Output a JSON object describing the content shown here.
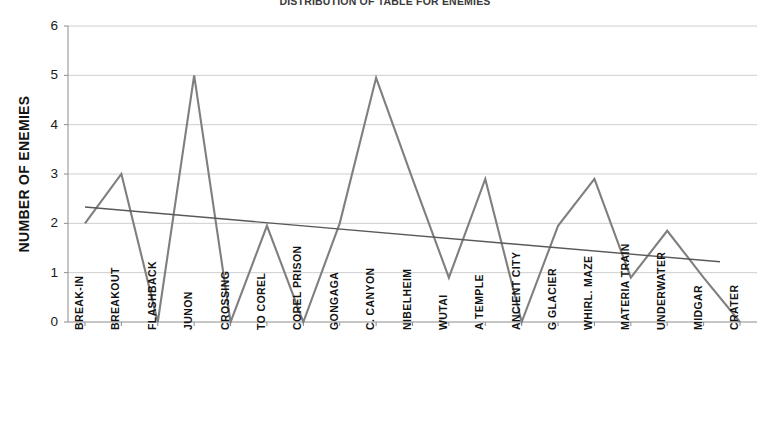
{
  "chart_data": {
    "type": "line",
    "title": "DISTRIBUTION OF TABLE FOR ENEMIES",
    "xlabel": "",
    "ylabel": "NUMBER OF ENEMIES",
    "ylim": [
      0,
      6
    ],
    "yticks": [
      0,
      1,
      2,
      3,
      4,
      5,
      6
    ],
    "grid": true,
    "legend": "none",
    "categories": [
      "BREAK-IN",
      "BREAKOUT",
      "FLASHBACK",
      "JUNON",
      "CROSSING",
      "TO COREL",
      "COREL PRISON",
      "GONGAGA",
      "C. CANYON",
      "NIBELHEIM",
      "WUTAI",
      "A TEMPLE",
      "ANCIENT CITY",
      "G GLACIER",
      "WHIRL. MAZE",
      "MATERIA TRAIN",
      "UNDERWATER",
      "MIDGAR",
      "CRATER"
    ],
    "series": [
      {
        "name": "Number of enemies",
        "color": "#7f7f7f",
        "values": [
          2,
          3,
          0,
          5,
          0,
          1.95,
          0,
          2,
          4.95,
          2.9,
          0.9,
          2.9,
          0,
          1.95,
          2.9,
          0.9,
          1.85,
          0.9,
          0
        ]
      },
      {
        "name": "Linear trendline",
        "color": "#595959",
        "type": "trendline",
        "start_value": 2.33,
        "end_value": 1.22
      }
    ]
  },
  "axis": {
    "ytick_labels": [
      "0",
      "1",
      "2",
      "3",
      "4",
      "5",
      "6"
    ]
  },
  "colors": {
    "series_line": "#7f7f7f",
    "trendline": "#595959",
    "gridline": "#c8c8c8",
    "axis": "#8c8c8c",
    "text": "#141414"
  }
}
